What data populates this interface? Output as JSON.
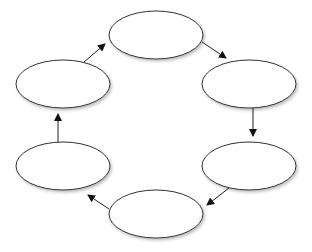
{
  "diagram": {
    "type": "cycle",
    "nodes": [
      {
        "id": "top",
        "label": "",
        "cx": 156,
        "cy": 35,
        "rx": 47,
        "ry": 24
      },
      {
        "id": "right-upper",
        "label": "",
        "cx": 249,
        "cy": 84,
        "rx": 47,
        "ry": 24
      },
      {
        "id": "right-lower",
        "label": "",
        "cx": 249,
        "cy": 166,
        "rx": 47,
        "ry": 24
      },
      {
        "id": "bottom",
        "label": "",
        "cx": 156,
        "cy": 214,
        "rx": 47,
        "ry": 24
      },
      {
        "id": "left-lower",
        "label": "",
        "cx": 63,
        "cy": 166,
        "rx": 47,
        "ry": 24
      },
      {
        "id": "left-upper",
        "label": "",
        "cx": 63,
        "cy": 84,
        "rx": 47,
        "ry": 24
      }
    ],
    "edges": [
      {
        "from": "top",
        "to": "right-upper"
      },
      {
        "from": "right-upper",
        "to": "right-lower"
      },
      {
        "from": "right-lower",
        "to": "bottom"
      },
      {
        "from": "bottom",
        "to": "left-lower"
      },
      {
        "from": "left-lower",
        "to": "left-upper"
      },
      {
        "from": "left-upper",
        "to": "top"
      }
    ],
    "colors": {
      "node_fill": "#ffffff",
      "node_stroke": "#333333",
      "arrow": "#222222"
    }
  }
}
